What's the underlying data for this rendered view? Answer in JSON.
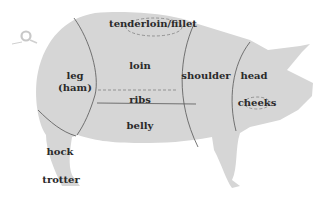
{
  "colors": {
    "body_fill": "#d6d6d6",
    "line": "#555555",
    "text": "#2a2a2a",
    "background": "#ffffff"
  },
  "cuts": {
    "tenderloin": "tenderloin/fillet",
    "loin": "loin",
    "leg_line1": "leg",
    "leg_line2": "(ham)",
    "ribs": "ribs",
    "belly": "belly",
    "shoulder": "shoulder",
    "head": "head",
    "cheeks": "cheeks",
    "hock": "hock",
    "trotter": "trotter"
  }
}
